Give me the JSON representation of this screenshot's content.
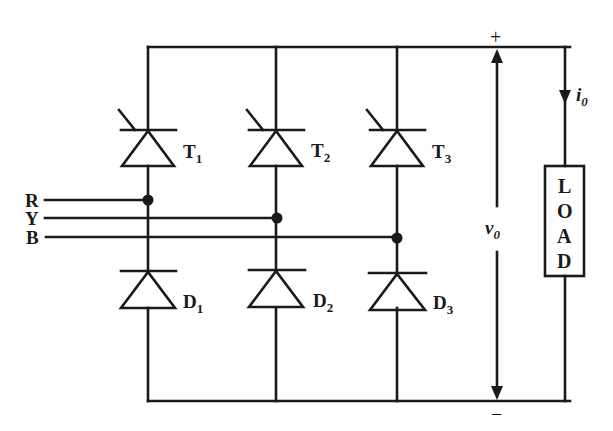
{
  "diagram": {
    "type": "three-phase half-controlled bridge rectifier",
    "phases": [
      {
        "label": "R",
        "y": 200,
        "node_x": 148
      },
      {
        "label": "Y",
        "y": 218,
        "node_x": 277
      },
      {
        "label": "B",
        "y": 237,
        "node_x": 397
      }
    ],
    "thyristors": [
      {
        "label": "T",
        "sub": "1",
        "x": 148
      },
      {
        "label": "T",
        "sub": "2",
        "x": 276
      },
      {
        "label": "T",
        "sub": "3",
        "x": 397
      }
    ],
    "diodes": [
      {
        "label": "D",
        "sub": "1",
        "x": 148
      },
      {
        "label": "D",
        "sub": "2",
        "x": 276
      },
      {
        "label": "D",
        "sub": "3",
        "x": 397
      }
    ],
    "output_voltage": {
      "label": "v",
      "sub": "0",
      "plus": "+",
      "minus": "−"
    },
    "output_current": {
      "label": "i",
      "sub": "0"
    },
    "load": {
      "letters": [
        "L",
        "O",
        "A",
        "D"
      ]
    }
  }
}
